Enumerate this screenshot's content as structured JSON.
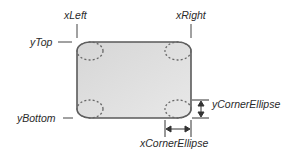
{
  "diagram": {
    "labels": {
      "xLeft": "xLeft",
      "xRight": "xRight",
      "yTop": "yTop",
      "yBottom": "yBottom",
      "yCornerEllipse": "yCornerEllipse",
      "xCornerEllipse": "xCornerEllipse"
    },
    "colors": {
      "fill": "#dcdcdc",
      "stroke": "#5a5a5a",
      "text": "#2a2a2a"
    }
  }
}
